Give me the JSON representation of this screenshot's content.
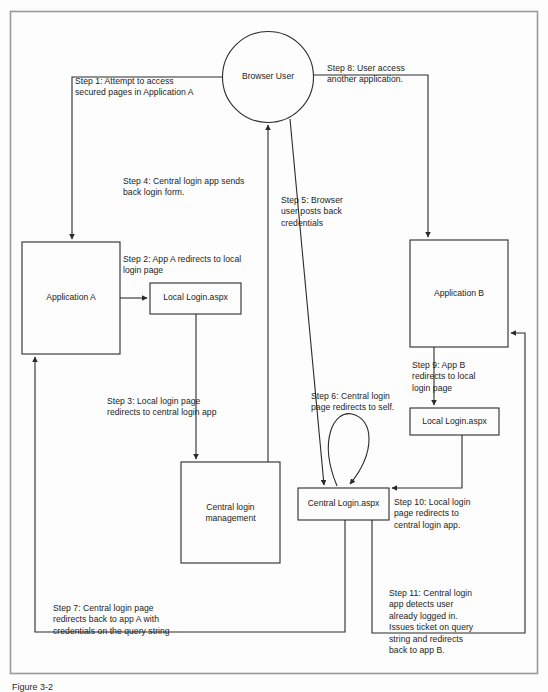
{
  "figure": {
    "caption": "Figure 3-2",
    "border_color": "#9a9a9a",
    "line_color": "#2b2b2b",
    "background": "#fdfdfd"
  },
  "nodes": {
    "browser_user": {
      "label": "Browser User",
      "shape": "circle"
    },
    "application_a": {
      "label": "Application A",
      "shape": "rect"
    },
    "local_login_a": {
      "label": "Local Login.aspx",
      "shape": "rect"
    },
    "central_login_management": {
      "label": "Central login\nmanagement",
      "shape": "rect"
    },
    "central_login_aspx": {
      "label": "Central Login.aspx",
      "shape": "rect"
    },
    "application_b": {
      "label": "Application B",
      "shape": "rect"
    },
    "local_login_b": {
      "label": "Local Login.aspx",
      "shape": "rect"
    }
  },
  "steps": {
    "step1": "Step 1: Attempt to access\nsecured pages in Application A",
    "step2": "Step 2: App A redirects to local\nlogin page",
    "step3": "Step 3: Local login page\nredirects to central login app",
    "step4": "Step 4: Central login app sends\nback login form.",
    "step5": "Step 5: Browser\nuser posts back\ncredentials",
    "step6": "Step 6: Central login\npage redirects to self.",
    "step7": "Step 7: Central login page\nredirects back to app A with\ncredentials on the query string",
    "step8": "Step 8: User access\nanother application.",
    "step9": "Step 9: App B\nredirects to local\nlogin page",
    "step10": "Step 10: Local login\npage redirects to\ncentral login app.",
    "step11": "Step 11: Central login\napp detects user\nalready logged in.\nIssues ticket on query\nstring and redirects\nback to app B."
  },
  "diagram_data": {
    "type": "flow-diagram",
    "title": "Single sign-on redirect flow between Application A, Application B and a central login app",
    "edges": [
      {
        "id": "step1",
        "from": "browser_user",
        "to": "application_a"
      },
      {
        "id": "step2",
        "from": "application_a",
        "to": "local_login_a"
      },
      {
        "id": "step3",
        "from": "local_login_a",
        "to": "central_login_management"
      },
      {
        "id": "step4",
        "from": "central_login_management",
        "to": "browser_user"
      },
      {
        "id": "step5",
        "from": "browser_user",
        "to": "central_login_aspx"
      },
      {
        "id": "step6",
        "from": "central_login_aspx",
        "to": "central_login_aspx"
      },
      {
        "id": "step7",
        "from": "central_login_aspx",
        "to": "application_a"
      },
      {
        "id": "step8",
        "from": "browser_user",
        "to": "application_b"
      },
      {
        "id": "step9",
        "from": "application_b",
        "to": "local_login_b"
      },
      {
        "id": "step10",
        "from": "local_login_b",
        "to": "central_login_aspx"
      },
      {
        "id": "step11",
        "from": "central_login_aspx",
        "to": "application_b"
      }
    ]
  }
}
